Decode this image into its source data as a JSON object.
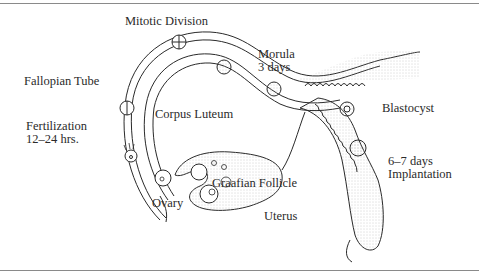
{
  "diagram": {
    "labels": {
      "mitotic_division": "Mitotic Division",
      "morula_line1": "Morula",
      "morula_line2": "3 days",
      "fallopian_tube": "Fallopian Tube",
      "corpus_luteum": "Corpus Luteum",
      "blastocyst": "Blastocyst",
      "fertilization_line1": "Fertilization",
      "fertilization_line2": "12–24 hrs.",
      "implantation_line1": "6–7 days",
      "implantation_line2": "Implantation",
      "graafian_follicle": "Graafian Follicle",
      "ovary": "Ovary",
      "uterus": "Uterus"
    },
    "colors": {
      "ink": "#2a2a2a",
      "stipple": "#bdbdbd",
      "frame": "#8a8a8a"
    }
  }
}
